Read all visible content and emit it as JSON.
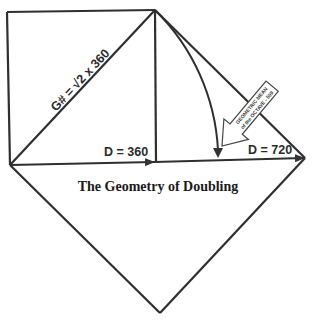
{
  "diagram": {
    "title": "The Geometry of Doubling",
    "labels": {
      "diagonal": "G# = √2  x 360",
      "d360": "D = 360",
      "d720": "D = 720"
    },
    "callout": {
      "line1": "GEOMETRIC MEAN",
      "line2": "of the OCTAVE - 509"
    },
    "colors": {
      "stroke": "#2f2f2f",
      "background": "#ffffff"
    }
  }
}
